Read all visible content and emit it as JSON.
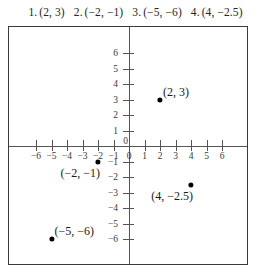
{
  "header": {
    "items": [
      {
        "num": "1.",
        "coord": "(2, 3)"
      },
      {
        "num": "2.",
        "coord": "(−2, −1)"
      },
      {
        "num": "3.",
        "coord": "(−5, −6)"
      },
      {
        "num": "4.",
        "coord": "(4, −2.5)"
      }
    ]
  },
  "chart_data": {
    "type": "scatter",
    "title": "",
    "xlabel": "",
    "ylabel": "",
    "xlim": [
      -7.7,
      7.7
    ],
    "ylim": [
      -7.7,
      7.7
    ],
    "grid": false,
    "legend": null,
    "x_ticks": [
      -6,
      -5,
      -4,
      -3,
      -2,
      -1,
      0,
      1,
      2,
      3,
      4,
      5,
      6
    ],
    "y_ticks": [
      -6,
      -5,
      -4,
      -3,
      -2,
      -1,
      1,
      2,
      3,
      4,
      5,
      6
    ],
    "x_tick_labels": [
      "−6",
      "−5",
      "−4",
      "−3",
      "−2",
      "−1",
      "0",
      "1",
      "2",
      "3",
      "4",
      "5",
      "6"
    ],
    "y_tick_labels": [
      "−6",
      "−5",
      "−4",
      "−3",
      "−2",
      "−1",
      "1",
      "2",
      "3",
      "4",
      "5",
      "6"
    ],
    "origin_label": "0",
    "points": [
      {
        "x": 2,
        "y": 3,
        "label": "(2, 3)",
        "label_pos": "upper-right"
      },
      {
        "x": -2,
        "y": -1,
        "label": "(−2, −1)",
        "label_pos": "lower-left"
      },
      {
        "x": 4,
        "y": -2.5,
        "label": "(4, −2.5)",
        "label_pos": "lower-left"
      },
      {
        "x": -5,
        "y": -6,
        "label": "(−5, −6)",
        "label_pos": "upper-right"
      }
    ],
    "series": [
      {
        "name": "plotted points",
        "x": [
          2,
          -2,
          4,
          -5
        ],
        "y": [
          3,
          -1,
          -2.5,
          -6
        ]
      }
    ]
  },
  "colors": {
    "point": "#000000",
    "axis": "#555555",
    "frame": "#3a3a3a",
    "background": "#ffffff",
    "text": "#1a1a1a"
  }
}
